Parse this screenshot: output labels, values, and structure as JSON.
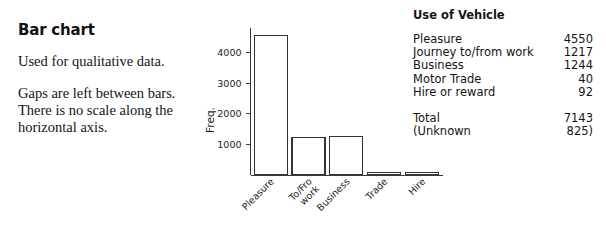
{
  "left_panel": {
    "title": "Bar chart",
    "paragraphs": [
      "Used for qualitative data.",
      "Gaps are left between bars. There is no scale along the horizontal axis."
    ]
  },
  "table": {
    "title": "Use of Vehicle",
    "rows": [
      {
        "label": "Pleasure",
        "value": "4550"
      },
      {
        "label": "Journey to/from work",
        "value": "1217"
      },
      {
        "label": "Business",
        "value": "1244"
      },
      {
        "label": "Motor Trade",
        "value": "40"
      },
      {
        "label": "Hire or reward",
        "value": "92"
      }
    ],
    "summary": [
      {
        "label": "Total",
        "value": "7143"
      },
      {
        "label": "(Unknown",
        "value": "825)"
      }
    ]
  },
  "chart_data": {
    "type": "bar",
    "title": "",
    "xlabel": "",
    "ylabel": "Freq.",
    "categories": [
      "Pleasure",
      "To/Fro work",
      "Business",
      "Trade",
      "Hire"
    ],
    "category_lines": [
      [
        "Pleasure"
      ],
      [
        "To/Fro",
        "work"
      ],
      [
        "Business"
      ],
      [
        "Trade"
      ],
      [
        "Hire"
      ]
    ],
    "values": [
      4550,
      1217,
      1244,
      40,
      92
    ],
    "yticks": [
      1000,
      2000,
      3000,
      4000
    ],
    "ytick_labels": [
      "1000",
      "2000",
      "3000",
      "4000"
    ],
    "ylim": [
      0,
      4800
    ],
    "grid": false,
    "legend": "none",
    "bar_fill": "#ffffff",
    "bar_stroke": "#333333",
    "axis_color": "#3a3a3a"
  }
}
